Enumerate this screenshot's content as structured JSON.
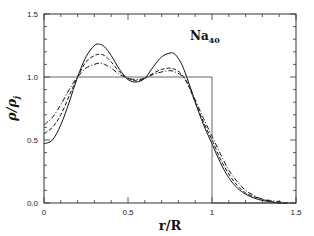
{
  "chart_data": {
    "type": "line",
    "title": "",
    "annotation": {
      "text": "Na",
      "subscript": "40"
    },
    "xlabel": "r/R",
    "ylabel": "ρ/ρj",
    "xlim": [
      0,
      1.5
    ],
    "ylim": [
      0,
      1.5
    ],
    "xticks": [
      0,
      0.5,
      1,
      1.5
    ],
    "xtick_labels": [
      "0",
      "0.5",
      "1",
      "1.5"
    ],
    "yticks": [
      0.0,
      0.5,
      1.0,
      1.5
    ],
    "ytick_labels": [
      "0.0",
      "0.5",
      "1.0",
      "1.5"
    ],
    "grid": false,
    "legend": null,
    "series": [
      {
        "name": "solid",
        "style": "solid",
        "x": [
          0.0,
          0.05,
          0.1,
          0.15,
          0.2,
          0.25,
          0.3,
          0.33,
          0.36,
          0.4,
          0.45,
          0.5,
          0.55,
          0.6,
          0.65,
          0.7,
          0.75,
          0.78,
          0.82,
          0.86,
          0.9,
          0.95,
          1.0,
          1.05,
          1.1,
          1.15,
          1.2,
          1.25,
          1.3,
          1.35,
          1.4,
          1.45
        ],
        "y": [
          0.47,
          0.5,
          0.62,
          0.8,
          1.0,
          1.16,
          1.25,
          1.26,
          1.24,
          1.17,
          1.06,
          0.98,
          0.96,
          0.99,
          1.08,
          1.16,
          1.19,
          1.18,
          1.1,
          0.96,
          0.8,
          0.62,
          0.47,
          0.32,
          0.2,
          0.12,
          0.07,
          0.04,
          0.02,
          0.01,
          0.0,
          0.0
        ]
      },
      {
        "name": "dashed",
        "style": "dashed",
        "x": [
          0.0,
          0.05,
          0.1,
          0.15,
          0.2,
          0.25,
          0.3,
          0.33,
          0.36,
          0.4,
          0.45,
          0.5,
          0.55,
          0.6,
          0.65,
          0.7,
          0.75,
          0.78,
          0.82,
          0.86,
          0.9,
          0.95,
          1.0,
          1.05,
          1.1,
          1.15,
          1.2,
          1.25,
          1.3,
          1.35,
          1.4,
          1.45
        ],
        "y": [
          0.55,
          0.6,
          0.7,
          0.85,
          1.0,
          1.12,
          1.17,
          1.18,
          1.17,
          1.12,
          1.04,
          0.99,
          0.97,
          0.99,
          1.03,
          1.06,
          1.07,
          1.06,
          1.02,
          0.93,
          0.8,
          0.64,
          0.5,
          0.35,
          0.23,
          0.14,
          0.08,
          0.05,
          0.03,
          0.01,
          0.0,
          0.0
        ]
      },
      {
        "name": "dash-dot",
        "style": "dashdot",
        "x": [
          0.0,
          0.05,
          0.1,
          0.15,
          0.2,
          0.25,
          0.3,
          0.33,
          0.36,
          0.4,
          0.45,
          0.5,
          0.55,
          0.6,
          0.65,
          0.7,
          0.75,
          0.78,
          0.82,
          0.86,
          0.9,
          0.95,
          1.0,
          1.05,
          1.1,
          1.15,
          1.2,
          1.25,
          1.3,
          1.35,
          1.4,
          1.45
        ],
        "y": [
          0.62,
          0.68,
          0.78,
          0.9,
          1.0,
          1.07,
          1.1,
          1.11,
          1.1,
          1.07,
          1.02,
          0.99,
          0.98,
          0.99,
          1.02,
          1.04,
          1.05,
          1.04,
          1.01,
          0.94,
          0.82,
          0.67,
          0.53,
          0.39,
          0.26,
          0.17,
          0.1,
          0.06,
          0.03,
          0.02,
          0.01,
          0.0
        ]
      },
      {
        "name": "step (jellium)",
        "style": "solid-thin",
        "x": [
          0.0,
          1.0,
          1.0,
          1.5
        ],
        "y": [
          1.0,
          1.0,
          0.0,
          0.0
        ]
      }
    ]
  },
  "plot_area": {
    "left": 44,
    "right": 296,
    "top": 14,
    "bottom": 203
  }
}
